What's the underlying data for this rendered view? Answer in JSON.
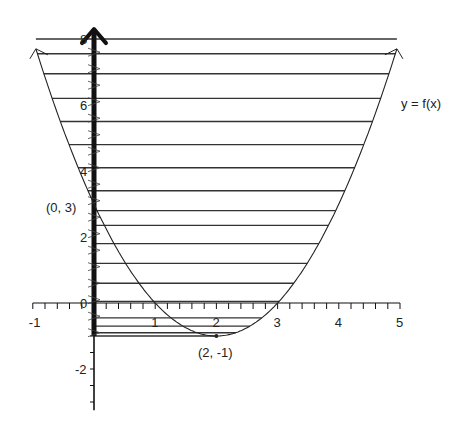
{
  "figure": {
    "function_label": "y = f(x)",
    "point_labels": {
      "y_intercept": "(0, 3)",
      "vertex": "(2, -1)"
    },
    "x_tick_labels": [
      "-1",
      "0",
      "1",
      "2",
      "3",
      "4",
      "5"
    ],
    "y_tick_labels": [
      "-2",
      "0",
      "2",
      "4",
      "6",
      "8"
    ],
    "colors": {
      "ink": "#222222",
      "axis": "#111111",
      "background": "#ffffff"
    }
  },
  "chart_data": {
    "type": "line",
    "title": "",
    "xlabel": "",
    "ylabel": "",
    "function": "f(x) = (x - 2)^2 - 1 = x^2 - 4x + 3",
    "xlim": [
      -1,
      5
    ],
    "ylim": [
      -3.2,
      8.3
    ],
    "x_ticks": [
      -1,
      0,
      1,
      2,
      3,
      4,
      5
    ],
    "y_ticks": [
      -2,
      0,
      2,
      4,
      6,
      8
    ],
    "x_minor_tick_step": 0.2,
    "y_minor_tick_step": 0.5,
    "series": [
      {
        "name": "y = f(x)",
        "x": [
          -0.95,
          -0.5,
          0,
          0.5,
          1,
          1.5,
          2,
          2.5,
          3,
          3.5,
          4,
          4.5,
          4.95
        ],
        "values": [
          7.8,
          5.25,
          3,
          1.25,
          0,
          -0.75,
          -1,
          -0.75,
          0,
          1.25,
          3,
          5.25,
          7.7
        ]
      }
    ],
    "annotations": [
      {
        "text": "(0, 3)",
        "x": 0,
        "y": 3
      },
      {
        "text": "(2, -1)",
        "x": 2,
        "y": -1
      },
      {
        "text": "y = f(x)",
        "x": 5.1,
        "y": 6.5
      }
    ],
    "shading": "horizontal hatch lines fill the region between the y-axis and the curve (x from 0 up to the curve, y from -1 to 8)",
    "hatch_y_values": [
      8.0,
      7.55,
      6.95,
      6.2,
      5.5,
      4.8,
      4.1,
      3.4,
      2.8,
      2.35,
      1.8,
      1.2,
      0.6,
      0.05,
      -0.45,
      -0.7,
      -0.9,
      -1.0
    ],
    "emphasized_axis": "y-axis drawn bold from y=-1 up to y=8 with arrowhead",
    "legend": "none",
    "grid": false
  }
}
